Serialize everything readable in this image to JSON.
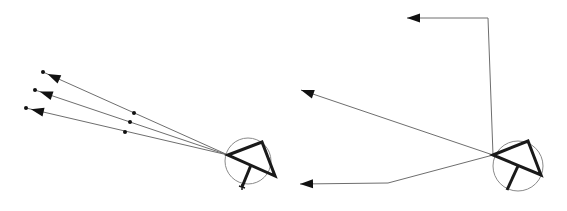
{
  "diagram": {
    "type": "ray-reflection-schematic",
    "width": 567,
    "height": 211,
    "colors": {
      "background": "#ffffff",
      "ray": "#6e6e6e",
      "body": "#1a1a1a",
      "circle": "#8a8a8a",
      "arrow": "#111111"
    },
    "figures": [
      {
        "id": "left",
        "circle": {
          "cx": 248,
          "cy": 161,
          "r": 23
        },
        "triangle": [
          [
            228,
            155
          ],
          [
            262,
            142
          ],
          [
            275,
            176
          ]
        ],
        "stem": {
          "from": [
            251,
            165
          ],
          "to": [
            242,
            187
          ],
          "cross": true
        },
        "origin": [
          228,
          155
        ],
        "rays": [
          {
            "end": [
              43,
              72
            ],
            "mid_dot": [
              134,
              113
            ],
            "tail_dot": [
              43,
              72
            ]
          },
          {
            "end": [
              35,
              90
            ],
            "mid_dot": [
              130,
              122
            ],
            "tail_dot": [
              35,
              90
            ]
          },
          {
            "end": [
              26,
              108
            ],
            "mid_dot": [
              125,
              132
            ],
            "tail_dot": [
              26,
              108
            ]
          }
        ]
      },
      {
        "id": "right",
        "circle": {
          "cx": 518,
          "cy": 166,
          "r": 25
        },
        "triangle": [
          [
            493,
            155
          ],
          [
            528,
            141
          ],
          [
            541,
            175
          ]
        ],
        "stem": {
          "from": [
            518,
            166
          ],
          "to": [
            507,
            190
          ],
          "cross": false
        },
        "origin": [
          493,
          155
        ],
        "rays": [
          {
            "points": [
              [
                493,
                155
              ],
              [
                488,
                18
              ],
              [
                407,
                18
              ]
            ]
          },
          {
            "points": [
              [
                493,
                155
              ],
              [
                301,
                90
              ]
            ]
          },
          {
            "points": [
              [
                493,
                155
              ],
              [
                388,
                183
              ],
              [
                300,
                184
              ]
            ]
          }
        ]
      }
    ]
  }
}
